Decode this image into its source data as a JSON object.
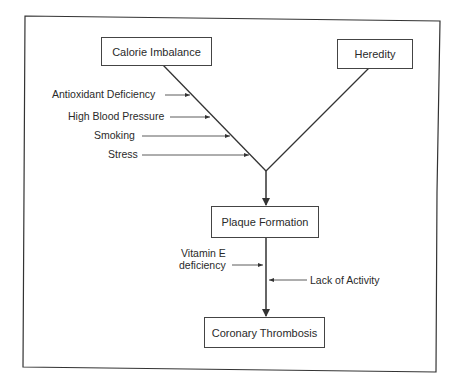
{
  "diagram": {
    "nodes": {
      "calorie_imbalance": "Calorie Imbalance",
      "heredity": "Heredity",
      "plaque_formation": "Plaque Formation",
      "coronary_thrombosis": "Coronary Thrombosis"
    },
    "left_factors": [
      "Antioxidant Deficiency",
      "High Blood Pressure",
      "Smoking",
      "Stress"
    ],
    "lower_factors": {
      "vitamin_e_line1": "Vitamin E",
      "vitamin_e_line2": "deficiency",
      "lack_of_activity": "Lack of Activity"
    }
  }
}
